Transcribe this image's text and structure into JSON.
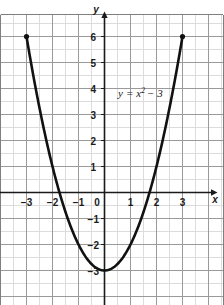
{
  "figure": {
    "label": "(2)"
  },
  "chart_data": {
    "type": "line",
    "title": "",
    "subtitle": "",
    "equation_label": "y = x² − 3",
    "equation_parts": {
      "lhs": "y",
      "eq": "=",
      "base": "x",
      "exponent": "2",
      "rest": "− 3"
    },
    "function": "y = x^2 - 3",
    "xlabel": "x",
    "ylabel": "y",
    "xlim": [
      -4.0,
      4.6
    ],
    "ylim": [
      -3.9,
      6.9
    ],
    "x_ticks": [
      -3,
      -2,
      -1,
      0,
      1,
      2,
      3
    ],
    "x_tick_labels": [
      "−3",
      "−2",
      "−1",
      "0",
      "1",
      "2",
      "3"
    ],
    "y_ticks": [
      6,
      5,
      4,
      3,
      2,
      1,
      -1,
      -2,
      -3
    ],
    "y_tick_labels": [
      "6",
      "5",
      "4",
      "3",
      "2",
      "1",
      "−1",
      "−2",
      "−3"
    ],
    "grid": true,
    "grid_major_step": 1,
    "grid_minor_step": 0.5,
    "legend": "none",
    "x": [
      -3,
      -2.5,
      -2,
      -1.5,
      -1,
      -0.5,
      0,
      0.5,
      1,
      1.5,
      2,
      2.5,
      3
    ],
    "values": [
      6,
      3.25,
      1,
      -0.75,
      -2,
      -2.75,
      -3,
      -2.75,
      -2,
      -0.75,
      1,
      3.25,
      6
    ],
    "vertex": [
      0,
      -3
    ],
    "x_intercepts": [
      -1.732,
      1.732
    ],
    "y_intercept": -3,
    "endpoints": [
      {
        "x": -3,
        "y": 6,
        "marker": "dot"
      },
      {
        "x": 3,
        "y": 6,
        "marker": "dot"
      }
    ],
    "curve_color": "#111111",
    "grid_major_color": "#9a9a9a",
    "grid_minor_color": "#d8d8d8",
    "axis_color": "#1a1a1a",
    "background_color": "#ffffff"
  }
}
